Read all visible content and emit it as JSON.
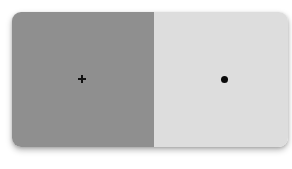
{
  "stimulus": {
    "panels": [
      {
        "id": "left",
        "color": "#8f8f8f",
        "marker": "plus-icon"
      },
      {
        "id": "right",
        "color": "#dddddd",
        "marker": "dot-icon"
      }
    ]
  }
}
